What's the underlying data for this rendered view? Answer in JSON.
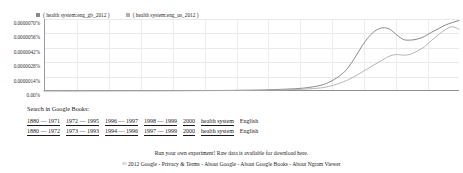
{
  "legend": {
    "items": [
      {
        "label": "( health system:eng_gb_2012 )",
        "swatch_color": "#8a8a8a",
        "icon": "legend-swatch-icon"
      },
      {
        "label": "( health system:eng_us_2012 )",
        "swatch_color": "#b0b0b0",
        "icon": "legend-swatch-icon"
      }
    ]
  },
  "chart_data": {
    "type": "line",
    "title": "",
    "xlabel": "",
    "ylabel": "",
    "grid": true,
    "legend_position": "top-left",
    "xlim": [
      1880,
      2000
    ],
    "ylim": [
      0,
      7e-06
    ],
    "ytick_labels": [
      "0.0000070%",
      "0.0000056%",
      "0.0000042%",
      "0.0000028%",
      "0.0000014%",
      "0.00%"
    ],
    "ytick_values": [
      7e-06,
      5.6e-06,
      4.2e-06,
      2.8e-06,
      1.4e-06,
      0.0
    ],
    "xtick_labels": [],
    "x": [
      1880,
      1890,
      1900,
      1910,
      1920,
      1930,
      1940,
      1945,
      1950,
      1955,
      1960,
      1963,
      1966,
      1968,
      1970,
      1972,
      1974,
      1976,
      1978,
      1980,
      1982,
      1984,
      1986,
      1988,
      1990,
      1992,
      1994,
      1996,
      1998,
      2000
    ],
    "series": [
      {
        "name": "( health system:eng_gb_2012 )",
        "color": "#7d7d7d",
        "values": [
          2e-08,
          2e-08,
          3e-08,
          3e-08,
          4e-08,
          5e-08,
          8e-08,
          1.2e-07,
          1.8e-07,
          2.8e-07,
          5.5e-07,
          9.5e-07,
          1.6e-06,
          2.3e-06,
          3.3e-06,
          4.4e-06,
          5.3e-06,
          5.9e-06,
          6.15e-06,
          6e-06,
          5.45e-06,
          5e-06,
          4.95e-06,
          5.05e-06,
          5.3e-06,
          5.7e-06,
          6.05e-06,
          6.4e-06,
          6.65e-06,
          6.85e-06
        ]
      },
      {
        "name": "( health system:eng_us_2012 )",
        "color": "#adadad",
        "values": [
          2e-08,
          2e-08,
          2e-08,
          3e-08,
          3e-08,
          4e-08,
          6e-08,
          8e-08,
          1.2e-07,
          1.8e-07,
          3e-07,
          5e-07,
          8.2e-07,
          1.1e-06,
          1.45e-06,
          1.85e-06,
          2.25e-06,
          2.65e-06,
          3.05e-06,
          3.4e-06,
          3.55e-06,
          3.48e-06,
          3.58e-06,
          3.9e-06,
          4.3e-06,
          4.9e-06,
          5.45e-06,
          5.95e-06,
          6.25e-06,
          6e-06
        ]
      }
    ]
  },
  "search": {
    "heading": "Search in Google Books:",
    "columns": [
      "range1",
      "range2",
      "range3",
      "range4",
      "range5",
      "query",
      "language"
    ],
    "rows": [
      {
        "ranges": [
          "1880 — 1971",
          "1972 — 1995",
          "1996 — 1997",
          "1998 — 1999",
          "2000"
        ],
        "query": "health system",
        "language": "English"
      },
      {
        "ranges": [
          "1880 — 1972",
          "1973 — 1993",
          "1994 — 1996",
          "1997 — 1999",
          "2000"
        ],
        "query": "health system",
        "language": "English"
      }
    ]
  },
  "footer": {
    "experiment_text": "Run your own experiment! Raw data is available for download here.",
    "copyright": "© 2012 Google - Privacy & Terms - About Google - About Google Books - About Ngram Viewer"
  }
}
